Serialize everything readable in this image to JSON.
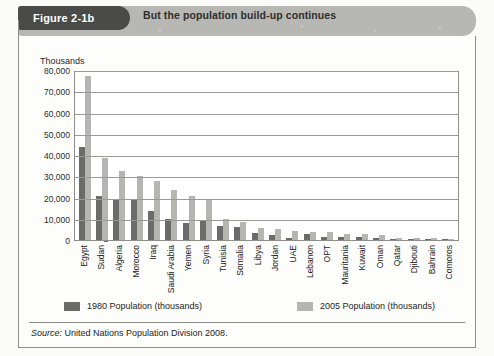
{
  "figure": {
    "tab_label": "Figure 2-1b",
    "banner_title": "But the population build-up continues"
  },
  "source": {
    "prefix": "Source:",
    "text": " United Nations Population Division 2008."
  },
  "legend": {
    "series_1_label": "1980 Population (thousands)",
    "series_2_label": "2005 Population (thousands)",
    "series_1_color": "#6b6b69",
    "series_2_color": "#b5b5b1"
  },
  "chart_data": {
    "type": "bar",
    "title": "But the population build-up continues",
    "subtitle": "Figure 2-1b",
    "xlabel": "",
    "ylabel": "Thousands",
    "ylim": [
      0,
      80000
    ],
    "yticks": [
      0,
      10000,
      20000,
      30000,
      40000,
      50000,
      60000,
      70000,
      80000
    ],
    "ytick_labels": [
      "0",
      "10,000",
      "20,000",
      "30,000",
      "40,000",
      "50,000",
      "60,000",
      "70,000",
      "80,000"
    ],
    "grid": true,
    "legend_position": "below-plot",
    "categories": [
      "Egypt",
      "Sudan",
      "Algeria",
      "Morocco",
      "Iraq",
      "Saudi Arabia",
      "Yemen",
      "Syria",
      "Tunisia",
      "Somalia",
      "Libya",
      "Jordan",
      "UAE",
      "Lebanon",
      "OPT",
      "Mauritania",
      "Kuwait",
      "Oman",
      "Qatar",
      "Djibouti",
      "Bahrain",
      "Comoros"
    ],
    "series": [
      {
        "name": "1980 Population (thousands)",
        "color": "#6b6b69",
        "values": [
          44000,
          20500,
          19000,
          19500,
          13500,
          9800,
          8000,
          8800,
          6400,
          6200,
          3100,
          2200,
          1000,
          2700,
          1500,
          1500,
          1400,
          1100,
          230,
          340,
          350,
          350
        ]
      },
      {
        "name": "2005 Population (thousands)",
        "color": "#b5b5b1",
        "values": [
          77000,
          38500,
          32700,
          30300,
          27800,
          23600,
          20800,
          19000,
          10000,
          8300,
          5800,
          5400,
          4100,
          4000,
          3700,
          3000,
          2600,
          2500,
          800,
          790,
          720,
          600
        ]
      }
    ]
  }
}
